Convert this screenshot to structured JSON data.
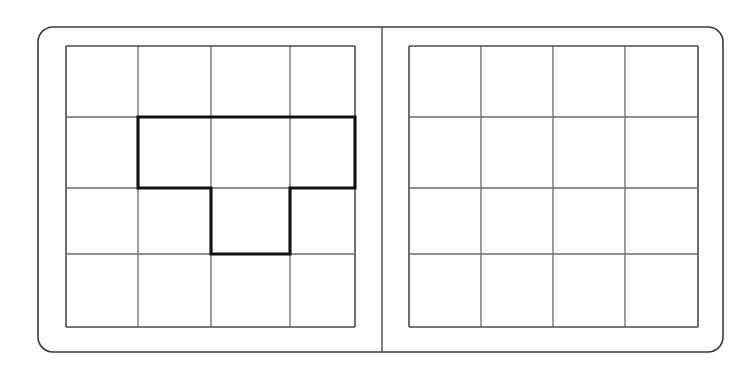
{
  "page": {
    "width": 756,
    "height": 370,
    "background_color": "#ffffff"
  },
  "colors": {
    "page_border": "#3a3a3a",
    "grid_line": "#6b6b6b",
    "grid_outer": "#4a4a4a",
    "shape_outline": "#111111",
    "spine": "#4a4a4a",
    "cell_fill": "#ffffff"
  },
  "binder": {
    "name": "open-two-page-spread",
    "outer_rect": {
      "x": 38,
      "y": 27,
      "width": 685,
      "height": 325,
      "radius": 15,
      "stroke_width": 1.6
    },
    "spine": {
      "x": 382,
      "y_top": 27,
      "y_bottom": 352,
      "stroke_width": 1.4
    }
  },
  "panels": [
    {
      "id": "left-panel",
      "label": "Left page with shape",
      "grid": {
        "name": "source-grid",
        "rows": 4,
        "cols": 4,
        "x_lines": [
          66,
          138,
          211,
          290,
          355
        ],
        "y_lines": [
          46,
          117,
          188,
          254,
          327
        ],
        "line_width": 1.3,
        "outer_line_width": 1.6
      },
      "has_shape": true
    },
    {
      "id": "right-panel",
      "label": "Right page blank answer grid",
      "grid": {
        "name": "answer-grid",
        "rows": 4,
        "cols": 4,
        "x_lines": [
          409,
          481,
          553,
          625,
          698
        ],
        "y_lines": [
          46,
          117,
          188,
          254,
          327
        ],
        "line_width": 1.3,
        "outer_line_width": 1.6
      },
      "has_shape": false
    }
  ],
  "shape": {
    "name": "bold-polyomino-outline",
    "description": "P-shaped tetromino/pentomino style outline drawn over the left grid",
    "cell_count": 4,
    "filled_cells": [
      {
        "row": 2,
        "col": 2
      },
      {
        "row": 2,
        "col": 3
      },
      {
        "row": 2,
        "col": 4
      },
      {
        "row": 3,
        "col": 3
      }
    ],
    "stroke_width": 3.1,
    "outline_points": "138,117 355,117 355,188 290,188 290,254 211,254 211,188 138,188 138,117",
    "vertices": [
      {
        "x": 138,
        "y": 117
      },
      {
        "x": 355,
        "y": 117
      },
      {
        "x": 355,
        "y": 188
      },
      {
        "x": 290,
        "y": 188
      },
      {
        "x": 290,
        "y": 254
      },
      {
        "x": 211,
        "y": 254
      },
      {
        "x": 211,
        "y": 188
      },
      {
        "x": 138,
        "y": 188
      }
    ]
  }
}
